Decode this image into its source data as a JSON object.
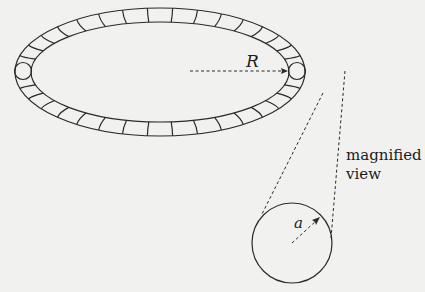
{
  "diagram": {
    "labels": {
      "major_radius": "R",
      "minor_radius": "a",
      "magnified_line1": "magnified",
      "magnified_line2": "view"
    },
    "colors": {
      "background": "#f1f1f0",
      "stroke": "#2a2a2a"
    },
    "torus": {
      "center": [
        160,
        72
      ],
      "outer_rx": 145,
      "outer_ry": 64,
      "inner_rx": 129,
      "inner_ry": 50,
      "segment_count": 36
    },
    "magnified_circle": {
      "center": [
        292,
        243
      ],
      "radius": 40
    }
  }
}
